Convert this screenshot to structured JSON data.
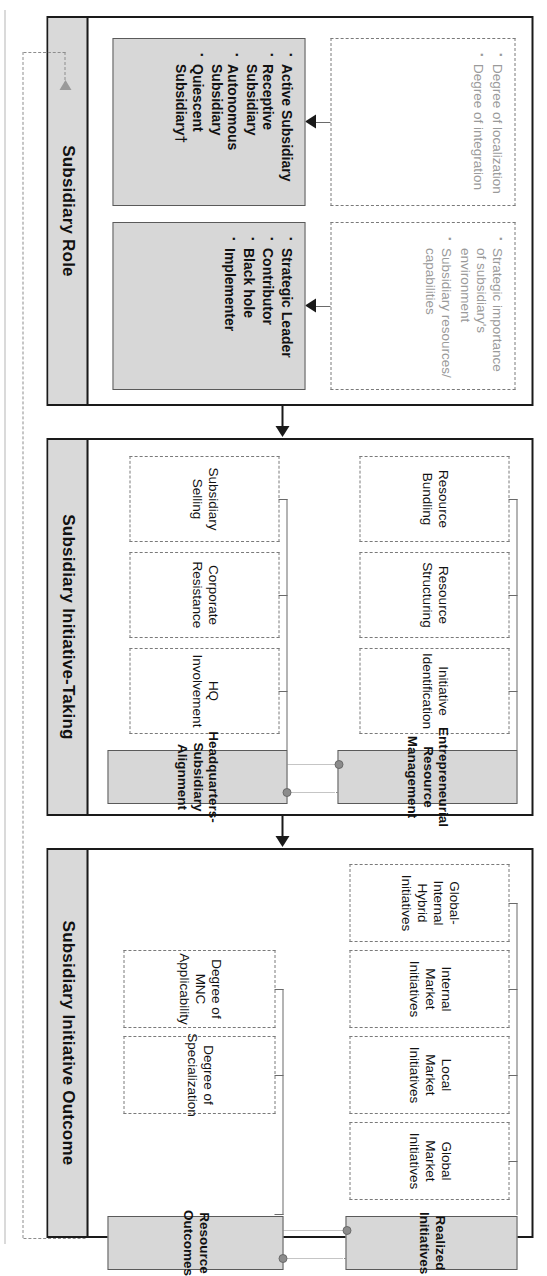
{
  "figure": {
    "sections": [
      {
        "id": "subsidiary-role",
        "title": "Subsidiary Role",
        "antecedent_groups": [
          {
            "id": "role-antecedents-1",
            "items": [
              "Degree of localization",
              "Degree of integration"
            ]
          },
          {
            "id": "role-antecedents-2",
            "items": [
              "Strategic importance of subsidiary's environment",
              "Subsidiary resources/ capabilities"
            ]
          }
        ],
        "outcome_groups": [
          {
            "id": "role-types-1",
            "items": [
              "Active Subsidiary",
              "Receptive Subsidiary",
              "Autonomous Subsidiary",
              "Quiescent Subsidiary†"
            ]
          },
          {
            "id": "role-types-2",
            "items": [
              "Strategic Leader",
              "Contributor",
              "Black hole",
              "Implementer"
            ]
          }
        ]
      },
      {
        "id": "subsidiary-initiative-taking",
        "title": "Subsidiary Initiative-Taking",
        "constructs": [
          {
            "id": "entrepreneurial-resource-management",
            "label": "Entrepreneurial Resource Management",
            "children": [
              "Initiative Identification",
              "Resource Structuring",
              "Resource Bundling"
            ]
          },
          {
            "id": "headquarters-subsidiary-alignment",
            "label": "Headquarters- Subsidiary Alignment",
            "children": [
              "HQ Involvement",
              "Corporate Resistance",
              "Subsidiary Selling"
            ]
          }
        ]
      },
      {
        "id": "subsidiary-initiative-outcome",
        "title": "Subsidiary Initiative Outcome",
        "constructs": [
          {
            "id": "realized-initiatives",
            "label": "Realized Initiatives",
            "children": [
              "Global Market Initiatives",
              "Local Market Initiatives",
              "Internal Market Initiatives",
              "Global-Internal Hybrid Initiatives"
            ]
          },
          {
            "id": "resource-outcomes",
            "label": "Resource Outcomes",
            "children": [
              "Degree of Specialization",
              "Degree of MNC Applicability"
            ]
          }
        ]
      }
    ],
    "flow_arrows": [
      {
        "id": "arrow-role-to-initiative",
        "from": "subsidiary-role",
        "to": "subsidiary-initiative-taking"
      },
      {
        "id": "arrow-initiative-to-outcome",
        "from": "subsidiary-initiative-taking",
        "to": "subsidiary-initiative-outcome"
      }
    ],
    "feedback_loop": {
      "id": "feedback-outcome-to-role",
      "from": "subsidiary-initiative-outcome",
      "to": "subsidiary-role",
      "style": "dashed"
    },
    "colors": {
      "construct_fill": "#d7d7d7",
      "band_title_fill": "#d9d9d9",
      "border": "#1a1a1a",
      "dashed_border": "#7a7a7a",
      "feedback": "#9a9a9a"
    }
  }
}
